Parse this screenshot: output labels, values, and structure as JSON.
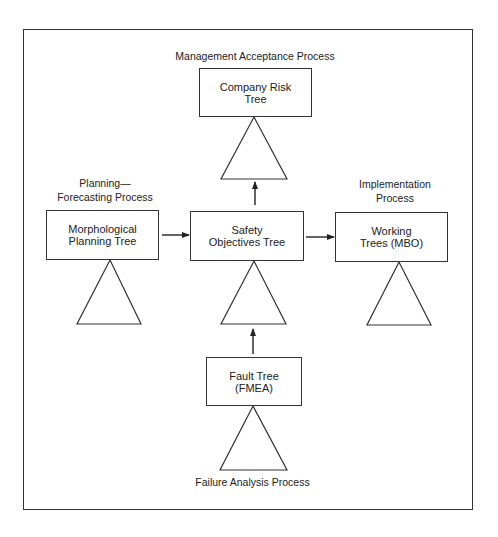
{
  "diagram": {
    "type": "process-flow",
    "process_labels": {
      "management": "Management Acceptance Process",
      "planning": "Planning—\nForecasting Process",
      "implementation": "Implementation\nProcess",
      "failure": "Failure Analysis Process"
    },
    "nodes": {
      "company_risk": "Company Risk\nTree",
      "morphological": "Morphological\nPlanning Tree",
      "safety": "Safety\nObjectives Tree",
      "working": "Working\nTrees (MBO)",
      "fault": "Fault Tree\n(FMEA)"
    },
    "edges": [
      {
        "from": "Morphological Planning Tree",
        "to": "Safety Objectives Tree"
      },
      {
        "from": "Safety Objectives Tree",
        "to": "Working Trees (MBO)"
      },
      {
        "from": "Safety Objectives Tree",
        "to": "Company Risk Tree"
      },
      {
        "from": "Fault Tree (FMEA)",
        "to": "Safety Objectives Tree"
      }
    ],
    "colors": {
      "stroke": "#333333",
      "text": "#222222",
      "background": "#ffffff"
    }
  }
}
